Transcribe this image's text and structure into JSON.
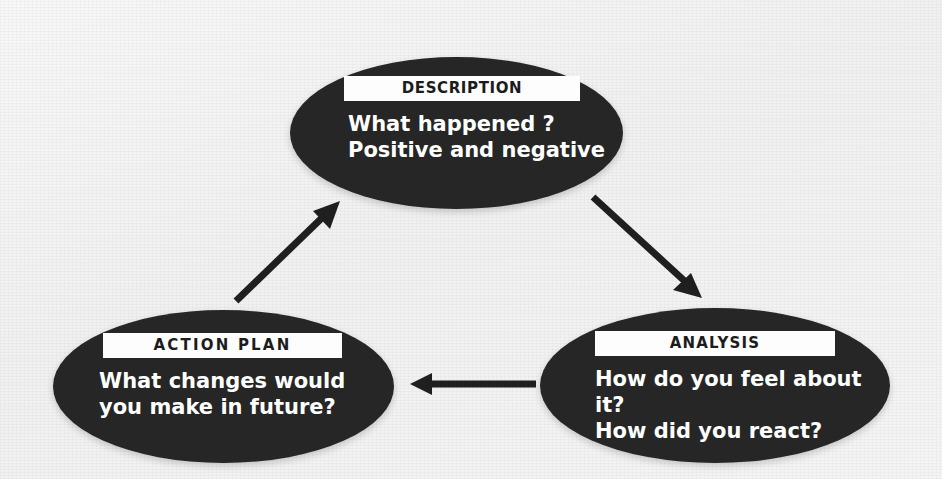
{
  "diagram": {
    "background_color": "#f4f4f4",
    "node_fill_color": "#262626",
    "node_text_color": "#ffffff",
    "label_background_color": "#fdfdfd",
    "label_text_color": "#1c1c1c",
    "arrow_color": "#1f1f1f",
    "nodes": [
      {
        "id": "description",
        "label": "DESCRIPTION",
        "body": "What happened ?\nPositive and negative"
      },
      {
        "id": "action-plan",
        "label": "ACTION PLAN",
        "body": "What changes would\nyou make in future?"
      },
      {
        "id": "analysis",
        "label": "ANALYSIS",
        "body": "How do you feel about it?\nHow did you react?"
      }
    ],
    "arrows": [
      {
        "id": "description-to-analysis",
        "from": "description",
        "to": "analysis",
        "direction": "down-right",
        "icon": "arrow-down-right-icon"
      },
      {
        "id": "analysis-to-action-plan",
        "from": "analysis",
        "to": "action-plan",
        "direction": "left",
        "icon": "arrow-left-icon"
      },
      {
        "id": "action-plan-to-description",
        "from": "action-plan",
        "to": "description",
        "direction": "up-right",
        "icon": "arrow-up-right-icon"
      }
    ]
  }
}
